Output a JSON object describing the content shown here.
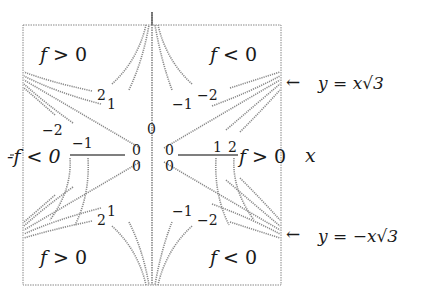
{
  "figure": {
    "regions": {
      "top_left": "f > 0",
      "top_right": "f < 0",
      "left": "-f < 0",
      "right": "f > 0",
      "bottom_left": "f > 0",
      "bottom_right": "f < 0"
    },
    "axis_label_x": "x",
    "asymptotes": {
      "upper": "y = x√3",
      "lower": "y = −x√3"
    },
    "arrow_glyph": "←",
    "level_labels": {
      "tl_2": "2",
      "tl_1": "1",
      "tr_m1": "−1",
      "tr_m2": "−2",
      "l_m2": "−2",
      "l_m1": "−1",
      "c_top": "0",
      "c_ul": "0",
      "c_ur": "0",
      "c_ll": "0",
      "c_lr": "0",
      "r_1": "1",
      "r_2": "2",
      "bl_2": "2",
      "bl_1": "1",
      "br_m1": "−1",
      "br_m2": "−2"
    }
  }
}
